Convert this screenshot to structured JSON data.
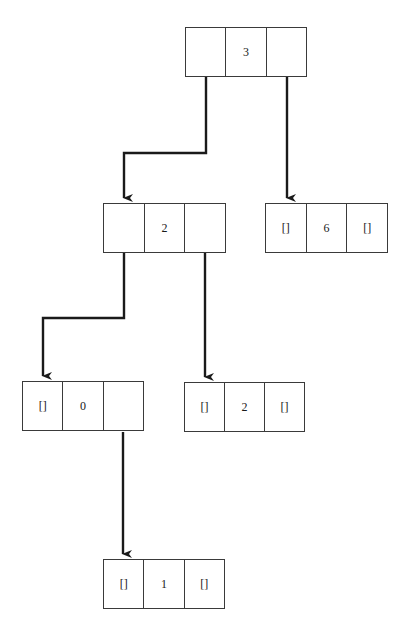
{
  "diagram": {
    "type": "binary-tree",
    "colors": {
      "line": "#1a1a1a",
      "border": "#3a3a3a",
      "background": "#ffffff"
    },
    "nodes": [
      {
        "id": "n3",
        "left": "",
        "value": "3",
        "right": "",
        "x": 185,
        "y": 27,
        "w": 122
      },
      {
        "id": "n2a",
        "left": "",
        "value": "2",
        "right": "",
        "x": 103,
        "y": 203,
        "w": 123
      },
      {
        "id": "n6",
        "left": "[]",
        "value": "6",
        "right": "[]",
        "x": 265,
        "y": 203,
        "w": 123
      },
      {
        "id": "n0",
        "left": "[]",
        "value": "0",
        "right": "",
        "x": 22,
        "y": 381,
        "w": 122
      },
      {
        "id": "n2b",
        "left": "[]",
        "value": "2",
        "right": "[]",
        "x": 184,
        "y": 382,
        "w": 121
      },
      {
        "id": "n1",
        "left": "[]",
        "value": "1",
        "right": "[]",
        "x": 103,
        "y": 559,
        "w": 122
      }
    ],
    "edges": [
      {
        "from": "n3",
        "side": "left",
        "to": "n2a"
      },
      {
        "from": "n3",
        "side": "right",
        "to": "n6"
      },
      {
        "from": "n2a",
        "side": "left",
        "to": "n0"
      },
      {
        "from": "n2a",
        "side": "right",
        "to": "n2b"
      },
      {
        "from": "n0",
        "side": "right",
        "to": "n1"
      }
    ]
  }
}
